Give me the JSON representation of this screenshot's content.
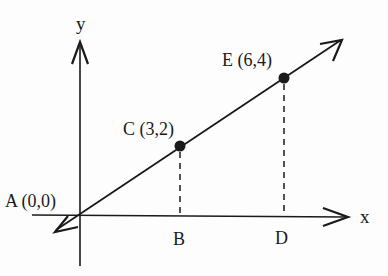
{
  "diagram": {
    "type": "coordinate-geometry",
    "colors": {
      "ink": "#1a1a1a",
      "background": "#fdfdfd"
    },
    "axes": {
      "x_label": "x",
      "y_label": "y"
    },
    "points": [
      {
        "id": "A",
        "label": "A (0,0)",
        "x": 0,
        "y": 0
      },
      {
        "id": "C",
        "label": "C (3,2)",
        "x": 3,
        "y": 2,
        "marked": true
      },
      {
        "id": "E",
        "label": "E (6,4)",
        "x": 6,
        "y": 4,
        "marked": true
      },
      {
        "id": "B",
        "label": "B",
        "x": 3,
        "y": 0
      },
      {
        "id": "D",
        "label": "D",
        "x": 6,
        "y": 0
      }
    ],
    "line": {
      "through": [
        "A",
        "C",
        "E"
      ],
      "arrows": "both-ends"
    },
    "dashed_segments": [
      {
        "from": "C",
        "to": "B"
      },
      {
        "from": "E",
        "to": "D"
      }
    ]
  }
}
